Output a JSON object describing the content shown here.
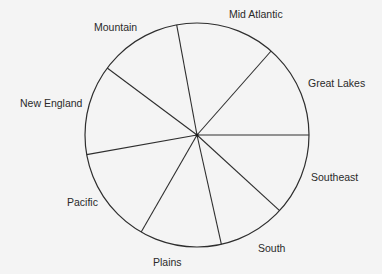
{
  "chart_data": {
    "type": "pie",
    "title": "",
    "center": [
      197,
      135
    ],
    "radius": 112,
    "start_angle_deg": 0,
    "direction": "counterclockwise",
    "categories": [
      "Great Lakes",
      "Mid Atlantic",
      "Mountain",
      "New England",
      "Pacific",
      "Plains",
      "South",
      "Southeast"
    ],
    "values": [
      13.5,
      14.4,
      11.9,
      13.0,
      13.9,
      11.8,
      9.7,
      11.8
    ],
    "unit": "percent (estimated from slice angles)",
    "labels": [
      {
        "text": "Great Lakes",
        "x": 308,
        "y": 87
      },
      {
        "text": "Mid Atlantic",
        "x": 229,
        "y": 18
      },
      {
        "text": "Mountain",
        "x": 94,
        "y": 31
      },
      {
        "text": "New England",
        "x": 20,
        "y": 107
      },
      {
        "text": "Pacific",
        "x": 67,
        "y": 206
      },
      {
        "text": "Plains",
        "x": 153,
        "y": 266
      },
      {
        "text": "South",
        "x": 258,
        "y": 252
      },
      {
        "text": "Southeast",
        "x": 311,
        "y": 181
      }
    ],
    "legend": "none",
    "grid": false,
    "colors": {
      "background": "#f4f4f4",
      "line": "#2e2e2e",
      "text": "#2a2a2a",
      "fill": "none"
    }
  }
}
